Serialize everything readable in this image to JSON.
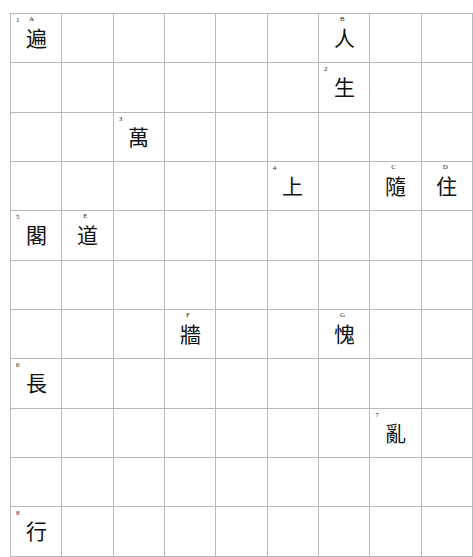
{
  "puzzle": {
    "kind": "crossword-grid",
    "columns": 9,
    "rows": 9,
    "cell_width_px": 50,
    "cell_height_px": 48,
    "colors": {
      "background": "#ffffff",
      "block": "#6e6e6e",
      "grid_line": "#b9b9b9",
      "text": "#111111"
    },
    "cells": [
      [
        {
          "state": "open",
          "number": "1",
          "letter": "A",
          "answer": "遍"
        },
        {
          "state": "open"
        },
        {
          "state": "open"
        },
        {
          "state": "open"
        },
        {
          "state": "open"
        },
        {
          "state": "open"
        },
        {
          "state": "open",
          "letter": "B",
          "answer": "人"
        },
        {
          "state": "block"
        },
        {
          "state": "block"
        }
      ],
      [
        {
          "state": "open"
        },
        {
          "state": "block"
        },
        {
          "state": "block"
        },
        {
          "state": "block"
        },
        {
          "state": "block"
        },
        {
          "state": "block"
        },
        {
          "state": "open",
          "number": "2",
          "answer": "生"
        },
        {
          "state": "open"
        },
        {
          "state": "open"
        }
      ],
      [
        {
          "state": "open"
        },
        {
          "state": "block"
        },
        {
          "state": "open",
          "number": "3",
          "answer": "萬"
        },
        {
          "state": "open"
        },
        {
          "state": "open"
        },
        {
          "state": "open"
        },
        {
          "state": "open"
        },
        {
          "state": "block"
        },
        {
          "state": "block"
        }
      ],
      [
        {
          "state": "open"
        },
        {
          "state": "block"
        },
        {
          "state": "block"
        },
        {
          "state": "block"
        },
        {
          "state": "block"
        },
        {
          "state": "open",
          "number": "4",
          "answer": "上"
        },
        {
          "state": "open"
        },
        {
          "state": "open",
          "letter": "C",
          "answer": "隨"
        },
        {
          "state": "open",
          "letter": "D",
          "answer": "住"
        }
      ],
      [
        {
          "state": "open",
          "number": "5",
          "answer": "閣"
        },
        {
          "state": "open",
          "letter": "E",
          "answer": "道"
        },
        {
          "state": "open"
        },
        {
          "state": "open"
        },
        {
          "state": "open"
        },
        {
          "state": "open"
        },
        {
          "state": "block"
        },
        {
          "state": "open"
        },
        {
          "state": "block"
        }
      ],
      [
        {
          "state": "block"
        },
        {
          "state": "open"
        },
        {
          "state": "block"
        },
        {
          "state": "block"
        },
        {
          "state": "block"
        },
        {
          "state": "block"
        },
        {
          "state": "block"
        },
        {
          "state": "open"
        },
        {
          "state": "block"
        }
      ],
      [
        {
          "state": "block"
        },
        {
          "state": "open"
        },
        {
          "state": "block"
        },
        {
          "state": "open",
          "letter": "F",
          "answer": "牆"
        },
        {
          "state": "block"
        },
        {
          "state": "block"
        },
        {
          "state": "open",
          "letter": "G",
          "answer": "愧"
        },
        {
          "state": "block"
        },
        {
          "state": "open"
        }
      ],
      [
        {
          "state": "open",
          "number": "6",
          "answer": "長"
        },
        {
          "state": "open"
        },
        {
          "state": "open"
        },
        {
          "state": "open"
        },
        {
          "state": "open"
        },
        {
          "state": "block"
        },
        {
          "state": "open"
        },
        {
          "state": "block"
        },
        {
          "state": "open"
        }
      ],
      [
        {
          "state": "block"
        },
        {
          "state": "open"
        },
        {
          "state": "block"
        },
        {
          "state": "open"
        },
        {
          "state": "block"
        },
        {
          "state": "block"
        },
        {
          "state": "open"
        },
        {
          "state": "open",
          "number": "7",
          "answer": "亂"
        },
        {
          "state": "open"
        }
      ],
      [
        {
          "state": "block"
        },
        {
          "state": "open"
        },
        {
          "state": "block"
        },
        {
          "state": "block"
        },
        {
          "state": "block"
        },
        {
          "state": "block"
        },
        {
          "state": "open"
        },
        {
          "state": "block"
        },
        {
          "state": "open"
        }
      ],
      [
        {
          "state": "open",
          "number": "8",
          "answer": "行"
        },
        {
          "state": "open"
        },
        {
          "state": "open"
        },
        {
          "state": "open"
        },
        {
          "state": "open"
        },
        {
          "state": "block"
        },
        {
          "state": "block"
        },
        {
          "state": "block"
        },
        {
          "state": "block"
        }
      ]
    ]
  }
}
